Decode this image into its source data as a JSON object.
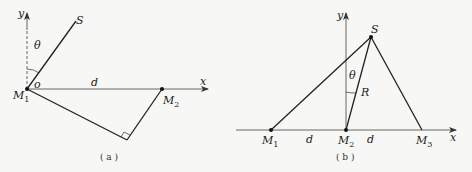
{
  "panel_a": {
    "caption": "( a )",
    "axis_x": "x",
    "axis_y": "y",
    "angle": "θ",
    "origin": "o",
    "distance": "d",
    "source": "S",
    "point1": {
      "base": "M",
      "sub": "1"
    },
    "point2": {
      "base": "M",
      "sub": "2"
    }
  },
  "panel_b": {
    "caption": "( b )",
    "axis_x": "x",
    "axis_y": "y",
    "angle": "θ",
    "radius": "R",
    "distance_left": "d",
    "distance_right": "d",
    "source": "S",
    "point1": {
      "base": "M",
      "sub": "1"
    },
    "point2": {
      "base": "M",
      "sub": "2"
    },
    "point3": {
      "base": "M",
      "sub": "3"
    }
  }
}
